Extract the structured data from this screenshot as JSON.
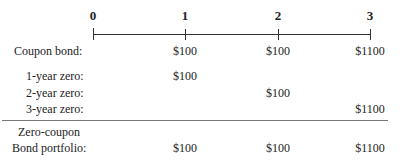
{
  "timeline": {
    "ticks": [
      "0",
      "1",
      "2",
      "3"
    ]
  },
  "rows": [
    {
      "label": "Coupon bond:",
      "values": [
        "$100",
        "$100",
        "$1100"
      ]
    },
    {
      "label": "1-year zero:",
      "values": [
        "$100",
        "",
        ""
      ]
    },
    {
      "label": "2-year zero:",
      "values": [
        "",
        "$100",
        ""
      ]
    },
    {
      "label": "3-year zero:",
      "values": [
        "",
        "",
        "$1100"
      ]
    }
  ],
  "portfolio": {
    "label_line1": "Zero-coupon",
    "label_line2": "Bond portfolio:",
    "values": [
      "$100",
      "$100",
      "$1100"
    ]
  }
}
